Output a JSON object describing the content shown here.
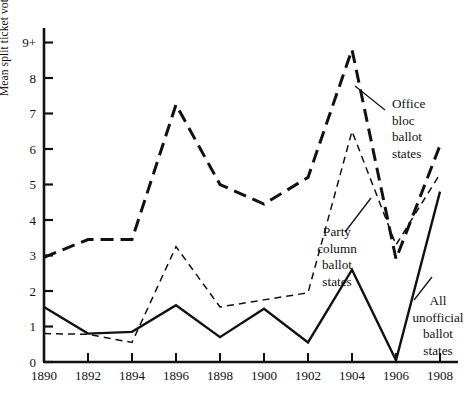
{
  "chart_data": {
    "type": "line",
    "title": "",
    "xlabel": "",
    "ylabel": "Mean split ticket voting percents",
    "x": [
      1890,
      1892,
      1894,
      1896,
      1898,
      1900,
      1902,
      1904,
      1906,
      1908
    ],
    "xticklabels": [
      "1890",
      "1892",
      "1894",
      "1896",
      "1898",
      "1900",
      "1902",
      "1904",
      "1906",
      "1908"
    ],
    "yticks": [
      0,
      1,
      2,
      3,
      4,
      5,
      6,
      7,
      8,
      9
    ],
    "yticklabels": [
      "0",
      "1",
      "2",
      "3",
      "4",
      "5",
      "6",
      "7",
      "8",
      "9+"
    ],
    "ylim": [
      0,
      9.4
    ],
    "xlim": [
      1890,
      1908
    ],
    "grid": false,
    "legend": "annotations-on-plot",
    "series": [
      {
        "name": "Office bloc ballot states",
        "style": "long-dash",
        "values": [
          2.95,
          3.45,
          3.45,
          7.25,
          5.0,
          4.45,
          5.2,
          8.8,
          2.9,
          6.1
        ]
      },
      {
        "name": "Party column ballot states",
        "style": "fine-dash",
        "values": [
          0.8,
          0.78,
          0.55,
          3.25,
          1.55,
          1.75,
          1.95,
          6.5,
          3.3,
          5.3
        ]
      },
      {
        "name": "All unofficial ballot states",
        "style": "solid",
        "values": [
          1.55,
          0.8,
          0.85,
          1.6,
          0.7,
          1.5,
          0.55,
          2.6,
          0.05,
          4.8
        ]
      }
    ],
    "annotations": [
      {
        "id": "office-bloc",
        "lines": [
          "Office",
          "bloc",
          "ballot",
          "states"
        ]
      },
      {
        "id": "party-column",
        "lines": [
          "Party",
          "column",
          "ballot",
          "states"
        ]
      },
      {
        "id": "all-unofficial",
        "lines": [
          "All",
          "unofficial",
          "ballot",
          "states"
        ]
      }
    ]
  },
  "axis": {
    "y_label_text": "Mean split ticket voting percents"
  },
  "colors": {
    "ink": "#111111",
    "background": "#ffffff"
  }
}
